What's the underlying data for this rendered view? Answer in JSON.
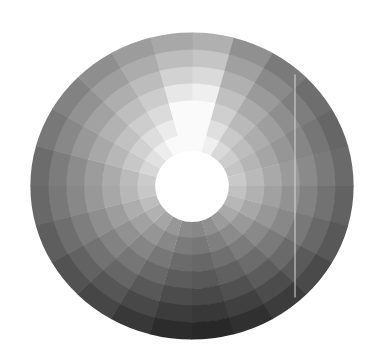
{
  "wheel": {
    "title": "Grayscale value wheel",
    "center": [
      192,
      186
    ],
    "radius_x": 161,
    "radius_y": 153,
    "hole_radius": 35,
    "rings": 7,
    "sectors": 24,
    "sector_degrees": 15,
    "outer_ring_gray": [
      176,
      144,
      122,
      110,
      102,
      106,
      98,
      88,
      74,
      60,
      48,
      40,
      44,
      56,
      70,
      82,
      94,
      104,
      108,
      120,
      130,
      142,
      156,
      168
    ],
    "inner_ring_boost": 95,
    "top_wedge_sectors": [
      0,
      23
    ],
    "top_wedge_extra": 30,
    "hole_color": "#ffffff",
    "seam_line": {
      "x": 295,
      "color": "#d8d8d8"
    }
  },
  "chart_data": {
    "type": "heatmap",
    "title": "",
    "sectors": 24,
    "rings": 7,
    "outer_ring_gray": [
      176,
      144,
      122,
      110,
      102,
      106,
      98,
      88,
      74,
      60,
      48,
      40,
      44,
      56,
      70,
      82,
      94,
      104,
      108,
      120,
      130,
      142,
      156,
      168
    ]
  }
}
